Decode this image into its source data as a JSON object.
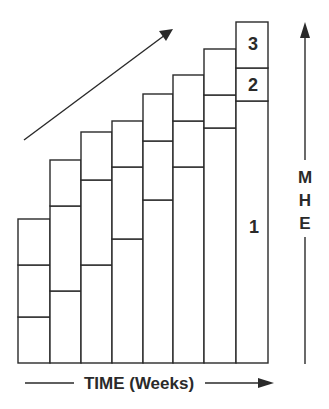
{
  "diagram": {
    "colors": {
      "stroke": "#2a2a2a",
      "background": "#ffffff"
    },
    "x_axis": {
      "label": "TIME (Weeks)",
      "direction": "right"
    },
    "y_axis": {
      "label_letters": [
        "M",
        "H",
        "E"
      ],
      "direction": "up"
    },
    "trend_arrow": {
      "direction": "up-right"
    },
    "segment_labels": [
      {
        "text": "1",
        "column": 8,
        "segment": 1
      },
      {
        "text": "2",
        "column": 8,
        "segment": 2
      },
      {
        "text": "3",
        "column": 8,
        "segment": 3
      }
    ],
    "baseline_y": 363,
    "columns": [
      {
        "x0": 18,
        "x1": 50,
        "tops": [
          317,
          265,
          219
        ]
      },
      {
        "x0": 50,
        "x1": 81,
        "tops": [
          291,
          206,
          160
        ]
      },
      {
        "x0": 81,
        "x1": 112,
        "tops": [
          265,
          180,
          132
        ]
      },
      {
        "x0": 112,
        "x1": 143,
        "tops": [
          239,
          167,
          121
        ]
      },
      {
        "x0": 143,
        "x1": 173,
        "tops": [
          200,
          141,
          94
        ]
      },
      {
        "x0": 173,
        "x1": 204,
        "tops": [
          167,
          121,
          75
        ]
      },
      {
        "x0": 204,
        "x1": 236,
        "tops": [
          128,
          95,
          49
        ]
      },
      {
        "x0": 236,
        "x1": 268,
        "tops": [
          101,
          68,
          22
        ]
      }
    ]
  }
}
